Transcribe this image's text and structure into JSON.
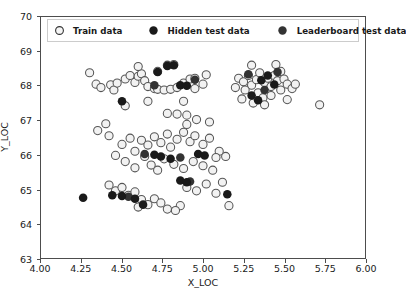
{
  "chart_data": {
    "type": "scatter",
    "title": "",
    "xlabel": "X_LOC",
    "ylabel": "Y_LOC",
    "xlim": [
      4.0,
      6.0
    ],
    "ylim": [
      63,
      70
    ],
    "xticks": [
      "4.00",
      "4.25",
      "4.50",
      "4.75",
      "5.00",
      "5.25",
      "5.50",
      "5.75",
      "6.00"
    ],
    "xtick_values": [
      4.0,
      4.25,
      4.5,
      4.75,
      5.0,
      5.25,
      5.5,
      5.75,
      6.0
    ],
    "yticks": [
      "63",
      "64",
      "65",
      "66",
      "67",
      "68",
      "69",
      "70"
    ],
    "ytick_values": [
      63,
      64,
      65,
      66,
      67,
      68,
      69,
      70
    ],
    "grid": false,
    "legend_position": "upper center",
    "series": [
      {
        "name": "Train data",
        "marker": "open-circle",
        "facecolor": "#f2f2f2",
        "edgecolor": "#555555",
        "points": [
          [
            4.3,
            68.38
          ],
          [
            4.43,
            68.03
          ],
          [
            4.45,
            67.88
          ],
          [
            4.47,
            68.08
          ],
          [
            4.52,
            68.2
          ],
          [
            4.55,
            68.3
          ],
          [
            4.58,
            68.1
          ],
          [
            4.6,
            68.28
          ],
          [
            4.62,
            68.35
          ],
          [
            4.64,
            68.15
          ],
          [
            4.66,
            67.98
          ],
          [
            4.7,
            67.92
          ],
          [
            4.72,
            67.9
          ],
          [
            4.76,
            67.88
          ],
          [
            4.8,
            67.9
          ],
          [
            4.84,
            67.95
          ],
          [
            4.88,
            68.08
          ],
          [
            4.92,
            68.2
          ],
          [
            4.95,
            67.92
          ],
          [
            4.52,
            67.42
          ],
          [
            4.6,
            68.56
          ],
          [
            4.72,
            68.42
          ],
          [
            4.95,
            68.22
          ],
          [
            5.0,
            68.05
          ],
          [
            5.02,
            68.32
          ],
          [
            4.78,
            68.6
          ],
          [
            4.82,
            68.62
          ],
          [
            4.34,
            68.05
          ],
          [
            4.37,
            67.95
          ],
          [
            4.88,
            67.55
          ],
          [
            4.84,
            67.18
          ],
          [
            4.78,
            67.2
          ],
          [
            4.9,
            67.15
          ],
          [
            4.66,
            67.55
          ],
          [
            5.22,
            68.22
          ],
          [
            5.25,
            68.12
          ],
          [
            5.28,
            68.3
          ],
          [
            5.3,
            68.02
          ],
          [
            5.33,
            68.18
          ],
          [
            5.35,
            68.38
          ],
          [
            5.38,
            68.1
          ],
          [
            5.4,
            68.22
          ],
          [
            5.42,
            67.98
          ],
          [
            5.44,
            68.3
          ],
          [
            5.46,
            68.15
          ],
          [
            5.48,
            68.42
          ],
          [
            5.5,
            68.2
          ],
          [
            5.52,
            68.05
          ],
          [
            5.3,
            68.6
          ],
          [
            5.45,
            68.62
          ],
          [
            5.26,
            67.88
          ],
          [
            5.34,
            67.8
          ],
          [
            5.37,
            67.65
          ],
          [
            5.42,
            67.72
          ],
          [
            5.48,
            67.88
          ],
          [
            5.52,
            67.6
          ],
          [
            5.55,
            67.92
          ],
          [
            5.57,
            68.05
          ],
          [
            5.31,
            67.5
          ],
          [
            5.38,
            67.45
          ],
          [
            5.24,
            67.62
          ],
          [
            5.2,
            67.95
          ],
          [
            5.72,
            67.45
          ],
          [
            4.42,
            66.55
          ],
          [
            4.5,
            66.3
          ],
          [
            4.55,
            66.48
          ],
          [
            4.58,
            66.1
          ],
          [
            4.62,
            66.42
          ],
          [
            4.66,
            66.28
          ],
          [
            4.7,
            66.52
          ],
          [
            4.74,
            66.35
          ],
          [
            4.78,
            66.6
          ],
          [
            4.8,
            66.22
          ],
          [
            4.84,
            66.45
          ],
          [
            4.88,
            66.65
          ],
          [
            4.92,
            66.38
          ],
          [
            4.95,
            66.55
          ],
          [
            5.0,
            66.3
          ],
          [
            5.04,
            66.48
          ],
          [
            4.46,
            65.98
          ],
          [
            4.52,
            65.8
          ],
          [
            4.58,
            65.62
          ],
          [
            4.64,
            65.95
          ],
          [
            4.68,
            65.7
          ],
          [
            4.72,
            65.55
          ],
          [
            4.76,
            65.88
          ],
          [
            4.82,
            65.72
          ],
          [
            4.88,
            65.6
          ],
          [
            4.94,
            65.8
          ],
          [
            5.0,
            65.68
          ],
          [
            5.06,
            65.55
          ],
          [
            4.42,
            65.12
          ],
          [
            4.46,
            64.95
          ],
          [
            4.5,
            65.05
          ],
          [
            4.54,
            64.82
          ],
          [
            4.58,
            64.92
          ],
          [
            4.62,
            64.7
          ],
          [
            4.66,
            64.55
          ],
          [
            4.7,
            64.72
          ],
          [
            4.74,
            64.6
          ],
          [
            4.6,
            64.48
          ],
          [
            4.9,
            65.05
          ],
          [
            4.96,
            64.95
          ],
          [
            5.02,
            65.15
          ],
          [
            5.08,
            64.88
          ],
          [
            5.12,
            65.2
          ],
          [
            4.86,
            64.52
          ],
          [
            5.16,
            64.52
          ],
          [
            5.04,
            66.95
          ],
          [
            4.96,
            67.02
          ],
          [
            4.9,
            66.88
          ],
          [
            4.4,
            66.9
          ],
          [
            4.35,
            66.7
          ],
          [
            5.1,
            66.1
          ],
          [
            5.14,
            65.95
          ],
          [
            5.08,
            65.92
          ],
          [
            4.78,
            64.42
          ],
          [
            4.83,
            64.38
          ]
        ]
      },
      {
        "name": "Hidden test data",
        "marker": "filled-circle",
        "color": "#1a1a1a",
        "points": [
          [
            4.5,
            67.55
          ],
          [
            4.78,
            68.58
          ],
          [
            4.82,
            68.6
          ],
          [
            4.72,
            68.4
          ],
          [
            4.86,
            68.02
          ],
          [
            4.9,
            68.0
          ],
          [
            5.36,
            68.16
          ],
          [
            5.4,
            68.3
          ],
          [
            5.44,
            68.04
          ],
          [
            5.3,
            67.72
          ],
          [
            5.34,
            67.58
          ],
          [
            4.26,
            64.75
          ],
          [
            4.44,
            64.82
          ],
          [
            4.5,
            64.8
          ],
          [
            4.58,
            64.72
          ],
          [
            4.7,
            66.0
          ],
          [
            4.74,
            65.95
          ],
          [
            4.8,
            65.88
          ],
          [
            4.97,
            66.02
          ],
          [
            5.01,
            65.98
          ],
          [
            4.86,
            65.25
          ],
          [
            4.9,
            65.2
          ],
          [
            5.15,
            64.85
          ],
          [
            4.63,
            64.55
          ]
        ]
      },
      {
        "name": "Leaderboard test data",
        "marker": "filled-circle",
        "color": "#333333",
        "points": [
          [
            4.7,
            68.02
          ],
          [
            4.95,
            68.18
          ],
          [
            5.28,
            68.34
          ],
          [
            5.46,
            68.4
          ],
          [
            5.38,
            67.88
          ],
          [
            4.64,
            66.02
          ],
          [
            4.86,
            65.92
          ],
          [
            4.92,
            65.22
          ],
          [
            4.54,
            64.78
          ]
        ]
      }
    ]
  },
  "legend": {
    "entries": [
      {
        "label": "Train data",
        "marker": "open-circle"
      },
      {
        "label": "Hidden test data",
        "marker": "filled-circle"
      },
      {
        "label": "Leaderboard test data",
        "marker": "filled-circle"
      }
    ]
  }
}
